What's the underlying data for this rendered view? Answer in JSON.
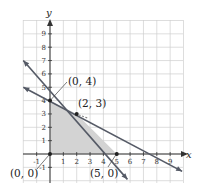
{
  "chart_data": {
    "type": "line",
    "title": "",
    "xlabel": "x",
    "ylabel": "y",
    "xlim": [
      -2,
      10
    ],
    "ylim": [
      -2,
      10
    ],
    "grid": true,
    "x_ticks": [
      "-1",
      "1",
      "2",
      "3",
      "4",
      "5",
      "6",
      "7",
      "8",
      "9"
    ],
    "y_ticks": [
      "-1",
      "1",
      "2",
      "3",
      "4",
      "5",
      "6",
      "7",
      "8",
      "9"
    ],
    "series": [
      {
        "name": "x + y = 5",
        "points": [
          [
            -2,
            7
          ],
          [
            5,
            0
          ],
          [
            5.8,
            -1.9
          ]
        ]
      },
      {
        "name": "x + 2y = 8",
        "points": [
          [
            -2,
            5
          ],
          [
            8,
            0
          ],
          [
            9.9,
            -1.3
          ]
        ]
      }
    ],
    "feasible_region": {
      "vertices": [
        [
          0,
          0
        ],
        [
          0,
          4
        ],
        [
          2,
          3
        ],
        [
          5,
          0
        ]
      ],
      "fill": "#d0d0d0"
    },
    "annotations": [
      {
        "label": "(0, 4)",
        "point": [
          0,
          4
        ]
      },
      {
        "label": "(2, 3)",
        "point": [
          2,
          3
        ]
      },
      {
        "label": "(0, 0)",
        "point": [
          0,
          0
        ]
      },
      {
        "label": "(5, 0)",
        "point": [
          5,
          0
        ]
      }
    ]
  },
  "labels": {
    "x_axis": "x",
    "y_axis": "y",
    "pt_0_4": "(0, 4)",
    "pt_2_3": "(2, 3)",
    "pt_0_0": "(0, 0)",
    "pt_5_0": "(5, 0)"
  },
  "colors": {
    "grid": "#cfcfcf",
    "axis": "#333333",
    "line": "#555a66",
    "region": "#d3d3d3"
  }
}
